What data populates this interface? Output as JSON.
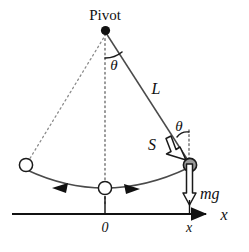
{
  "figure": {
    "type": "physics-diagram",
    "background_color": "#ffffff",
    "ink_color": "#111111",
    "bob_fill_color": "#9a9a9a",
    "width": 249,
    "height": 252
  },
  "labels": {
    "pivot": "Pivot",
    "theta_pivot": "θ",
    "theta_bob": "θ",
    "string_length": "L",
    "arc_length": "S",
    "weight": "mg",
    "axis_name": "x",
    "origin_tick": "0",
    "position_tick": "x"
  },
  "geometry": {
    "pivot": {
      "x": 105,
      "y": 30,
      "radius": 4.5
    },
    "bob": {
      "x": 190,
      "y": 165,
      "radius": 6.5
    },
    "rest_position": {
      "x": 105,
      "y": 188,
      "radius": 6.5
    },
    "left_position": {
      "x": 26,
      "y": 165,
      "radius": 6.5
    },
    "axis_y": 214,
    "axis_x_start": 12,
    "axis_x_end": 212,
    "origin_x": 105,
    "position_x": 190,
    "angle_arc_radius": 26
  },
  "elements": {
    "string_solid": "pivot-to-bob",
    "string_dashed_left": "pivot-to-left-position",
    "vertical_dashed": "pivot-to-rest-position",
    "swing_arc": "left-to-right-trajectory",
    "motion_arrow_left": "leftward-motion-arrow",
    "motion_arrow_right": "rightward-motion-arrow",
    "mg_arrow": "downward-weight-vector",
    "s_arrow": "tangential-displacement-vector",
    "x_axis_arrow": "positive-x-direction"
  }
}
